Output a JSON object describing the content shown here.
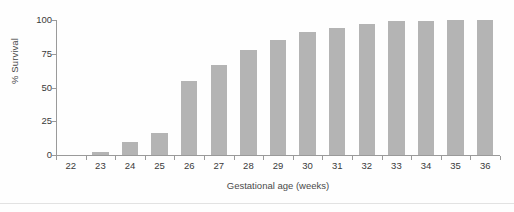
{
  "chart_data": {
    "type": "bar",
    "title": "",
    "subtitle": "",
    "xlabel": "Gestational age (weeks)",
    "ylabel": "% Survival",
    "categories": [
      "22",
      "23",
      "24",
      "25",
      "26",
      "27",
      "28",
      "29",
      "30",
      "31",
      "32",
      "33",
      "34",
      "35",
      "36"
    ],
    "values": [
      0,
      2,
      10,
      16,
      55,
      67,
      78,
      85,
      91,
      94,
      97,
      99,
      99,
      100,
      100
    ],
    "series": [
      {
        "name": "% Survival",
        "values": [
          0,
          2,
          10,
          16,
          55,
          67,
          78,
          85,
          91,
          94,
          97,
          99,
          99,
          100,
          100
        ]
      }
    ],
    "ylim": [
      0,
      100
    ],
    "yticks": [
      0,
      25,
      50,
      75,
      100
    ],
    "ytick_labels": [
      "0",
      "25",
      "50",
      "75",
      "100"
    ],
    "xtick_labels": [
      "22",
      "23",
      "24",
      "25",
      "26",
      "27",
      "28",
      "29",
      "30",
      "31",
      "32",
      "33",
      "34",
      "35",
      "36"
    ],
    "grid": false,
    "legend": "none",
    "bar_color": "#b4b4b4",
    "axis_color": "#9a9a9a",
    "text_color": "#3a3a3a"
  }
}
